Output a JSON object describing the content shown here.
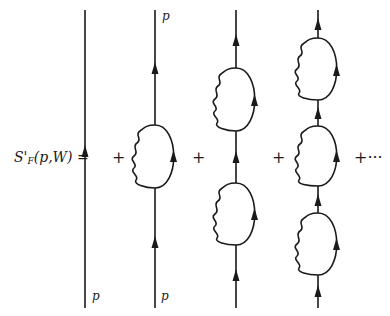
{
  "diagram": {
    "type": "feynman-diagram-series",
    "lhs": {
      "symbol": "S'",
      "subscript": "F",
      "args": "(p,W)",
      "equals": "="
    },
    "operators": {
      "plus": "+",
      "plus_etc": "+···"
    },
    "momentum_label": "p",
    "columns": [
      {
        "x": 85,
        "loops": 0,
        "labels": {
          "bottom": "p"
        },
        "arrows_y": [
          153
        ]
      },
      {
        "x": 155,
        "loops": 1,
        "labels": {
          "top": "p",
          "bottom": "p"
        },
        "loop_spans": [
          [
            125,
            188
          ]
        ],
        "arrows_y": [
          68,
          242
        ]
      },
      {
        "x": 236,
        "loops": 2,
        "loop_spans": [
          [
            68,
            131
          ],
          [
            183,
            245
          ]
        ],
        "arrows_y": [
          40,
          157,
          275
        ]
      },
      {
        "x": 318,
        "loops": 3,
        "loop_spans": [
          [
            38,
            100
          ],
          [
            126,
            186
          ],
          [
            213,
            275
          ]
        ],
        "arrows_y": [
          24,
          113,
          200,
          290
        ]
      }
    ],
    "line_top_y": 10,
    "line_bottom_y": 308
  }
}
